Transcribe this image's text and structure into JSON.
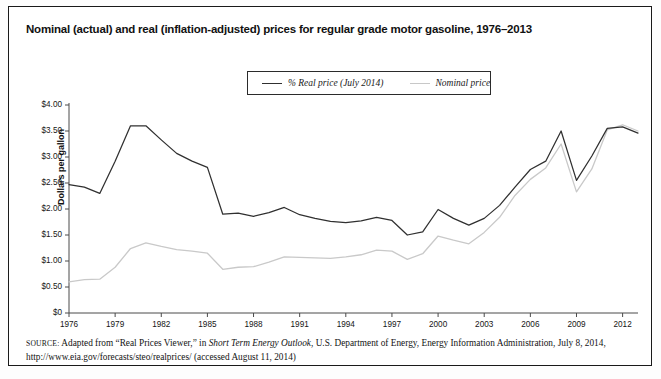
{
  "title": "Nominal (actual) and real (inflation-adjusted) prices for regular grade motor gasoline, 1976–2013",
  "legend": {
    "real_label": "% Real price (July 2014)",
    "nominal_label": "Nominal price"
  },
  "source": {
    "prefix": "SOURCE:",
    "text_1": " Adapted from “Real Prices Viewer,” in ",
    "italic_1": "Short Term Energy Outlook",
    "text_2": ", U.S. Department of Energy, Energy Information Administration, July 8, 2014,",
    "line_2": "http://www.eia.gov/forecasts/steo/realprices/ (accessed August 11, 2014)"
  },
  "colors": {
    "real_line": "#303030",
    "nominal_line": "#c9c9c9",
    "axis": "#4a4a4a",
    "frame": "#1a1a1a",
    "text": "#111111"
  },
  "chart_data": {
    "type": "line",
    "title": "Nominal (actual) and real (inflation-adjusted) prices for regular grade motor gasoline, 1976–2013",
    "xlabel": "",
    "ylabel": "Dollars per gallon",
    "grid": false,
    "legend_position": "top-center",
    "xlim": [
      1976,
      2013
    ],
    "ylim": [
      0,
      4.0
    ],
    "ytick_labels": [
      "$4.00",
      "$3.50",
      "$3.00",
      "$2.50",
      "$2.00",
      "$1.50",
      "$1.00",
      "$0.50",
      "$0"
    ],
    "ytick_values": [
      4.0,
      3.5,
      3.0,
      2.5,
      2.0,
      1.5,
      1.0,
      0.5,
      0
    ],
    "xtick_labels": [
      "1976",
      "1979",
      "1982",
      "1985",
      "1988",
      "1991",
      "1994",
      "1997",
      "2000",
      "2003",
      "2006",
      "2009",
      "2012"
    ],
    "xtick_values": [
      1976,
      1979,
      1982,
      1985,
      1988,
      1991,
      1994,
      1997,
      2000,
      2003,
      2006,
      2009,
      2012
    ],
    "x": [
      1976,
      1977,
      1978,
      1979,
      1980,
      1981,
      1982,
      1983,
      1984,
      1985,
      1986,
      1987,
      1988,
      1989,
      1990,
      1991,
      1992,
      1993,
      1994,
      1995,
      1996,
      1997,
      1998,
      1999,
      2000,
      2001,
      2002,
      2003,
      2004,
      2005,
      2006,
      2007,
      2008,
      2009,
      2010,
      2011,
      2012,
      2013
    ],
    "series": [
      {
        "name": "% Real price (July 2014)",
        "style": "solid-dark",
        "values": [
          2.47,
          2.42,
          2.3,
          2.92,
          3.6,
          3.6,
          3.33,
          3.07,
          2.92,
          2.8,
          1.9,
          1.92,
          1.86,
          1.93,
          2.03,
          1.89,
          1.82,
          1.76,
          1.74,
          1.77,
          1.84,
          1.78,
          1.5,
          1.56,
          1.99,
          1.82,
          1.69,
          1.82,
          2.07,
          2.42,
          2.76,
          2.92,
          3.5,
          2.55,
          3.02,
          3.55,
          3.58,
          3.46
        ]
      },
      {
        "name": "Nominal price",
        "style": "solid-light",
        "values": [
          0.6,
          0.64,
          0.65,
          0.88,
          1.24,
          1.35,
          1.28,
          1.22,
          1.19,
          1.15,
          0.84,
          0.88,
          0.89,
          0.98,
          1.08,
          1.07,
          1.06,
          1.05,
          1.08,
          1.12,
          1.21,
          1.19,
          1.03,
          1.14,
          1.48,
          1.4,
          1.33,
          1.55,
          1.84,
          2.26,
          2.57,
          2.79,
          3.25,
          2.33,
          2.77,
          3.52,
          3.62,
          3.5
        ]
      }
    ]
  }
}
